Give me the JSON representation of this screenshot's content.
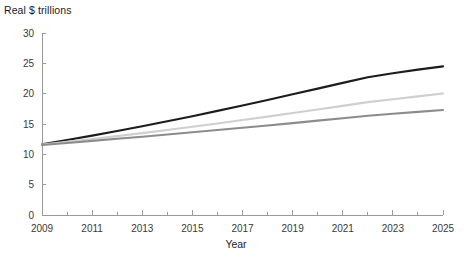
{
  "chart_data": {
    "type": "line",
    "title": "Real $ trillions",
    "xlabel": "Year",
    "ylabel": "",
    "x": [
      2009,
      2010,
      2011,
      2012,
      2013,
      2014,
      2015,
      2016,
      2017,
      2018,
      2019,
      2020,
      2021,
      2022,
      2023,
      2024,
      2025
    ],
    "xlim": [
      2009,
      2025
    ],
    "ylim": [
      0,
      30
    ],
    "xticks": [
      2009,
      2011,
      2013,
      2015,
      2017,
      2019,
      2021,
      2023,
      2025
    ],
    "xtick_labels": [
      "2009",
      "2011",
      "2013",
      "2015",
      "2017",
      "2019",
      "2021",
      "2023",
      "2025"
    ],
    "xminor_ticks": [
      2010,
      2012,
      2014,
      2016,
      2018,
      2020,
      2022,
      2024
    ],
    "yticks": [
      0,
      5,
      10,
      15,
      20,
      25,
      30
    ],
    "ytick_labels": [
      "0",
      "5",
      "10",
      "15",
      "20",
      "25",
      "30"
    ],
    "grid": false,
    "legend": "none",
    "series": [
      {
        "name": "high-growth-projection",
        "color": "#1c1c1c",
        "width": 2.1,
        "values": [
          11.65,
          12.35,
          13.08,
          13.84,
          14.63,
          15.44,
          16.29,
          17.16,
          18.05,
          18.96,
          19.89,
          20.83,
          21.78,
          22.72,
          23.37,
          23.96,
          24.5
        ]
      },
      {
        "name": "medium-growth-projection",
        "color": "#cfcfcf",
        "width": 2.1,
        "values": [
          11.6,
          12.05,
          12.52,
          13.0,
          13.5,
          14.02,
          14.55,
          15.09,
          15.65,
          16.22,
          16.8,
          17.39,
          17.99,
          18.6,
          19.08,
          19.56,
          20.02
        ]
      },
      {
        "name": "low-growth-projection",
        "color": "#8c8c8c",
        "width": 2.1,
        "values": [
          11.55,
          11.88,
          12.22,
          12.56,
          12.91,
          13.27,
          13.63,
          14.0,
          14.38,
          14.76,
          15.15,
          15.55,
          15.95,
          16.36,
          16.68,
          17.0,
          17.3
        ]
      }
    ],
    "axis_color": "#9a9a9a",
    "text_color": "#1a1a1a",
    "background": "#ffffff"
  }
}
